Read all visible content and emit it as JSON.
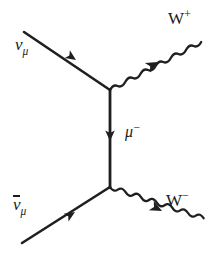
{
  "diagram": {
    "background_color": "#ffffff",
    "stroke_color": "#1f1f1f",
    "labels": {
      "incoming_top": {
        "base": "ν",
        "subscript": "μ",
        "overbar": false,
        "full": "νμ"
      },
      "incoming_bottom": {
        "base": "ν",
        "subscript": "μ",
        "overbar": true,
        "full": "ν̄μ"
      },
      "propagator": {
        "base": "μ",
        "superscript": "−",
        "full": "μ−"
      },
      "outgoing_top": {
        "base": "W",
        "superscript": "+",
        "full": "W+"
      },
      "outgoing_bottom": {
        "base": "W",
        "superscript": "−",
        "full": "W−"
      }
    },
    "vertices": [
      {
        "name": "upper-vertex",
        "x": 110,
        "y": 90
      },
      {
        "name": "lower-vertex",
        "x": 110,
        "y": 187
      }
    ],
    "lines": [
      {
        "name": "incoming-neutrino-line",
        "style": "straight",
        "from": [
          24,
          32
        ],
        "to": [
          110,
          90
        ],
        "arrow_at": [
          73,
          58
        ],
        "arrow_direction": "down-right"
      },
      {
        "name": "muon-propagator-line",
        "style": "straight",
        "from": [
          110,
          90
        ],
        "to": [
          110,
          187
        ],
        "arrow_at": [
          110,
          137
        ],
        "arrow_direction": "down"
      },
      {
        "name": "incoming-antineutrino-line",
        "style": "straight",
        "from": [
          22,
          243
        ],
        "to": [
          110,
          187
        ],
        "arrow_at": [
          70,
          215
        ],
        "arrow_direction": "up-right"
      },
      {
        "name": "outgoing-w-plus-wave",
        "style": "wavy",
        "from": [
          110,
          90
        ],
        "to": [
          205,
          38
        ],
        "arrow_at": [
          157,
          64
        ],
        "arrow_direction": "up-right"
      },
      {
        "name": "outgoing-w-minus-wave",
        "style": "wavy",
        "from": [
          110,
          187
        ],
        "to": [
          205,
          235
        ],
        "arrow_at": [
          160,
          210
        ],
        "arrow_direction": "down-right"
      }
    ]
  }
}
